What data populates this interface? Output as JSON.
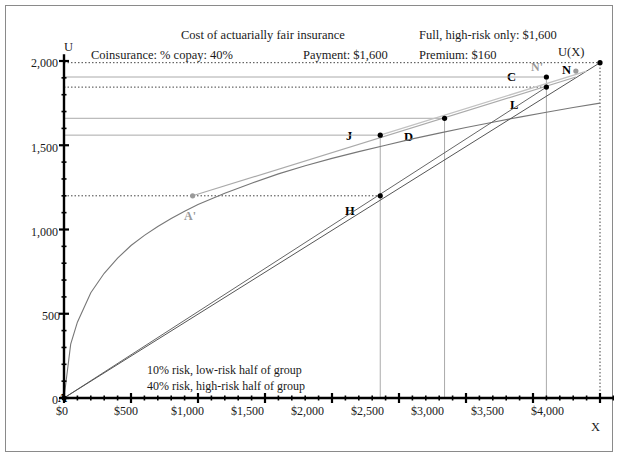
{
  "header": {
    "title": "Cost of actuarially fair insurance",
    "coinsurance": "Coinsurance: % copay: 40%",
    "payment": "Payment: $1,600",
    "full_high_risk": "Full, high-risk only: $1,600",
    "premium": "Premium: $160"
  },
  "axes": {
    "y_name": "U",
    "x_name": "X",
    "curve_name": "U(X)",
    "y_ticks": [
      "0",
      "500",
      "1,000",
      "1,500",
      "2,000"
    ],
    "y_tick_values": [
      0,
      500,
      1000,
      1500,
      2000
    ],
    "x_ticks": [
      "$0",
      "$500",
      "$1,000",
      "$1,500",
      "$2,000",
      "$2,500",
      "$3,000",
      "$3,500",
      "$4,000"
    ],
    "x_tick_values": [
      0,
      500,
      1000,
      1500,
      2000,
      2500,
      3000,
      3500,
      4000
    ]
  },
  "notes": {
    "low_risk": "10% risk, low-risk half of group",
    "high_risk": "40% risk, high-risk half of group"
  },
  "colors": {
    "curve": "#777777",
    "chord": "#555555",
    "gray_line": "#aaaaaa",
    "dotted": "#444444",
    "axis": "#000000",
    "frame": "#8a8a8a",
    "gray_label": "#9a9a9a"
  },
  "chart_data": {
    "type": "line",
    "title": "Cost of actuarially fair insurance",
    "xlabel": "X",
    "ylabel": "U",
    "xlim": [
      0,
      4200
    ],
    "ylim": [
      0,
      2080
    ],
    "grid": false,
    "legend": "none",
    "series": [
      {
        "name": "U(X)",
        "type": "curve",
        "note": "concave utility of wealth curve",
        "x": [
          0,
          50,
          100,
          200,
          300,
          400,
          500,
          600,
          700,
          800,
          900,
          1000,
          1200,
          1400,
          1600,
          1800,
          2000,
          2200,
          2400,
          2600,
          2800,
          3000,
          3200,
          3400,
          3600,
          3800,
          4000
        ],
        "y": [
          0,
          320,
          450,
          625,
          740,
          830,
          905,
          965,
          1018,
          1065,
          1108,
          1148,
          1215,
          1275,
          1330,
          1378,
          1422,
          1462,
          1500,
          1538,
          1572,
          1605,
          1637,
          1667,
          1696,
          1724,
          1750
        ]
      },
      {
        "name": "chord A-N",
        "type": "line",
        "x": [
          0,
          4000
        ],
        "y": [
          0,
          1960
        ]
      },
      {
        "name": "chord A-N-upper",
        "type": "line",
        "x": [
          0,
          4000
        ],
        "y": [
          0,
          1960
        ]
      },
      {
        "name": "gray segment A'-N'",
        "type": "line",
        "x": [
          960,
          3820
        ],
        "y": [
          1200,
          1905
        ]
      }
    ],
    "points": [
      {
        "label": "A",
        "x": 0,
        "y": 0,
        "color": "#000000"
      },
      {
        "label": "A'",
        "x": 960,
        "y": 1200,
        "color": "#9a9a9a"
      },
      {
        "label": "H",
        "x": 2360,
        "y": 1200,
        "color": "#000000"
      },
      {
        "label": "J",
        "x": 2360,
        "y": 1560,
        "color": "#000000"
      },
      {
        "label": "D",
        "x": 2840,
        "y": 1660,
        "color": "#000000"
      },
      {
        "label": "L",
        "x": 3600,
        "y": 1845,
        "color": "#000000"
      },
      {
        "label": "C",
        "x": 3600,
        "y": 1905,
        "color": "#000000"
      },
      {
        "label": "N'",
        "x": 3820,
        "y": 1940,
        "color": "#9a9a9a"
      },
      {
        "label": "N",
        "x": 4000,
        "y": 1990,
        "color": "#000000"
      }
    ],
    "reference_lines": {
      "horizontal": [
        {
          "y": 1990,
          "style": "dotted",
          "from_x": 0,
          "to_x": 4000
        },
        {
          "y": 1905,
          "style": "solid-gray",
          "from_x": 0,
          "to_x": 3600
        },
        {
          "y": 1845,
          "style": "dotted",
          "from_x": 0,
          "to_x": 3600
        },
        {
          "y": 1660,
          "style": "solid-gray",
          "from_x": 0,
          "to_x": 2840
        },
        {
          "y": 1560,
          "style": "solid-gray",
          "from_x": 0,
          "to_x": 2360
        },
        {
          "y": 1200,
          "style": "dotted",
          "from_x": 0,
          "to_x": 2360
        }
      ],
      "vertical": [
        {
          "x": 2360,
          "style": "solid-gray",
          "from_y": 0,
          "to_y": 1560
        },
        {
          "x": 2840,
          "style": "solid-gray",
          "from_y": 0,
          "to_y": 1660
        },
        {
          "x": 3600,
          "style": "solid-gray",
          "from_y": 0,
          "to_y": 1905
        },
        {
          "x": 4000,
          "style": "dotted",
          "from_y": 0,
          "to_y": 1990
        }
      ]
    },
    "annotations": [
      "10% risk, low-risk half of group",
      "40% risk, high-risk half of group"
    ]
  }
}
